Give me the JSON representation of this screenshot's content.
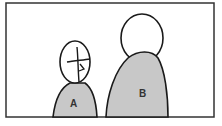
{
  "diagram": {
    "figures": [
      {
        "id": "figure-a",
        "label": "A",
        "description": "small figure with face"
      },
      {
        "id": "figure-b",
        "label": "B",
        "description": "large figure"
      }
    ],
    "colors": {
      "outline": "#1a1a1a",
      "body_fill": "#c8c8c8",
      "head_fill": "#ffffff",
      "frame": "#333333"
    }
  }
}
